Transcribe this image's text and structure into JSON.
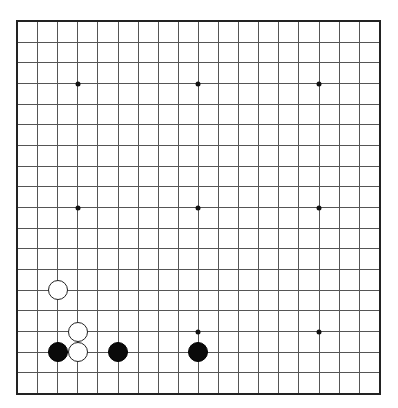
{
  "board": {
    "size": 19,
    "origin_x": 17.5,
    "origin_y": 21.5,
    "spacing_x": 20.1,
    "spacing_y": 20.67,
    "line_color": "#555555",
    "border_color": "#222222",
    "background": "#ffffff"
  },
  "star_points": [
    {
      "col": 3,
      "row": 3
    },
    {
      "col": 9,
      "row": 3
    },
    {
      "col": 15,
      "row": 3
    },
    {
      "col": 3,
      "row": 9
    },
    {
      "col": 9,
      "row": 9
    },
    {
      "col": 15,
      "row": 9
    },
    {
      "col": 3,
      "row": 15
    },
    {
      "col": 9,
      "row": 15
    },
    {
      "col": 15,
      "row": 15
    }
  ],
  "stones": [
    {
      "color": "white",
      "col": 2,
      "row": 13
    },
    {
      "color": "white",
      "col": 3,
      "row": 15
    },
    {
      "color": "white",
      "col": 3,
      "row": 16
    },
    {
      "color": "black",
      "col": 2,
      "row": 16
    },
    {
      "color": "black",
      "col": 5,
      "row": 16
    },
    {
      "color": "black",
      "col": 9,
      "row": 16
    }
  ]
}
